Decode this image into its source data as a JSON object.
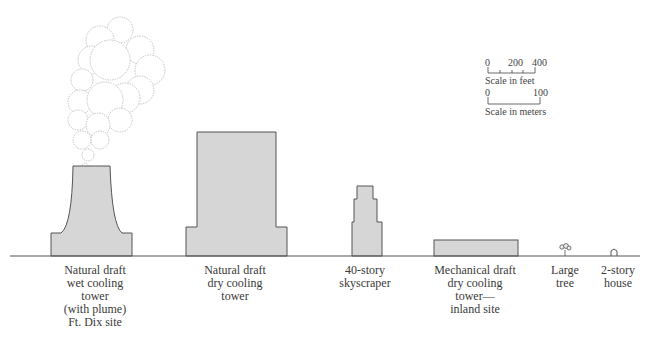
{
  "structures": [
    {
      "id": "natural-draft-wet",
      "label": "Natural draft\nwet cooling\ntower\n(with plume)\nFt. Dix site"
    },
    {
      "id": "natural-draft-dry",
      "label": "Natural draft\ndry cooling\ntower"
    },
    {
      "id": "skyscraper",
      "label": "40-story\nskyscraper"
    },
    {
      "id": "mechanical-draft-dry",
      "label": "Mechanical draft\ndry cooling\ntower—\ninland site"
    },
    {
      "id": "large-tree",
      "label": "Large\ntree"
    },
    {
      "id": "house",
      "label": "2-story\nhouse"
    }
  ],
  "scale_feet": {
    "ticks": [
      "0",
      "200",
      "400"
    ],
    "caption": "Scale in feet"
  },
  "scale_meters": {
    "ticks": [
      "0",
      "100"
    ],
    "caption": "Scale in meters"
  },
  "colors": {
    "fill": "#d6d6d6",
    "stroke": "#555555",
    "ground": "#555555"
  }
}
